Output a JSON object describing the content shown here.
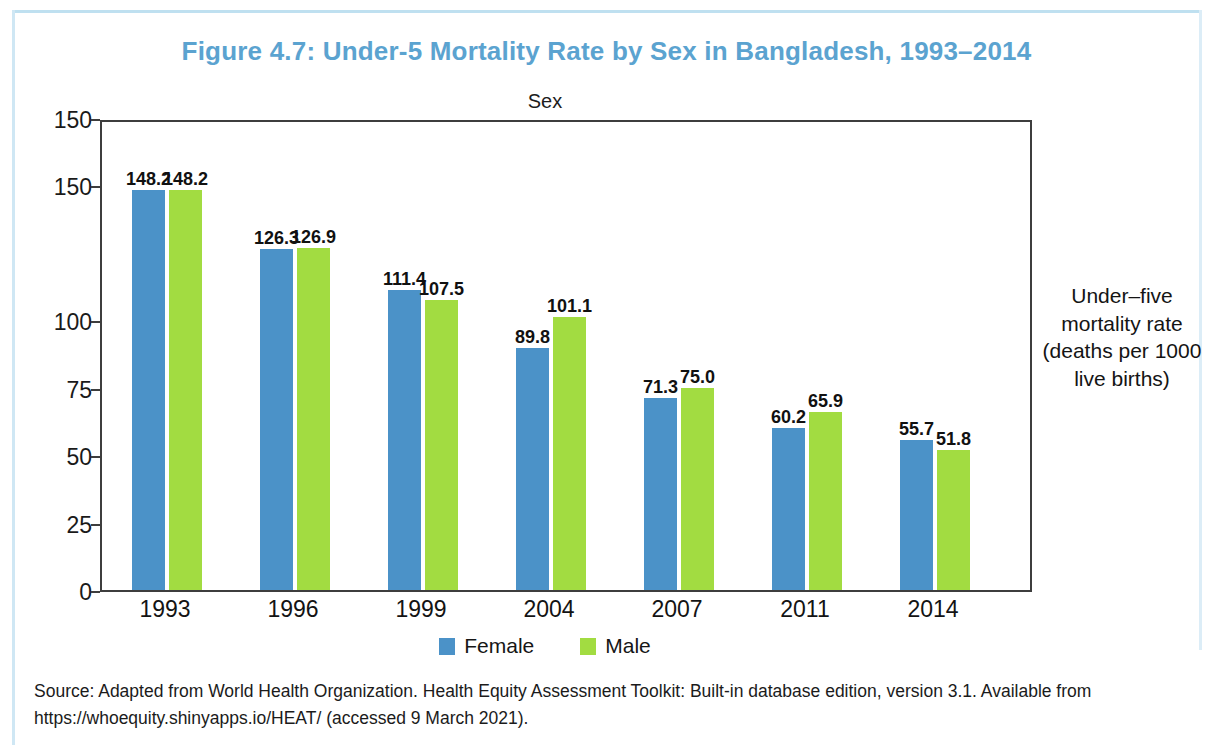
{
  "figure": {
    "title": "Figure 4.7: Under-5 Mortality Rate by Sex in Bangladesh, 1993–2014",
    "title_color": "#5ba3d0"
  },
  "source_note": "Source: Adapted from World Health Organization. Health Equity Assessment Toolkit: Built-in database edition, version 3.1. Available from https://whoequity.shinyapps.io/HEAT/ (accessed 9 March 2021).",
  "axis_caption": "Under–five mortality rate (deaths per 1000 live births)",
  "legend": {
    "title": "Sex",
    "items": [
      {
        "label": "Female",
        "color": "#4b92c8"
      },
      {
        "label": "Male",
        "color": "#a2dc41"
      }
    ]
  },
  "chart_data": {
    "type": "bar",
    "title": "Figure 4.7: Under-5 Mortality Rate by Sex in Bangladesh, 1993–2014",
    "xlabel": "",
    "ylabel": "Under-five mortality rate (deaths per 1000 live births)",
    "categories": [
      "1993",
      "1996",
      "1999",
      "2004",
      "2007",
      "2011",
      "2014"
    ],
    "series": [
      {
        "name": "Female",
        "color": "#4b92c8",
        "values": [
          148.2,
          126.3,
          111.4,
          89.8,
          71.3,
          60.2,
          55.7
        ]
      },
      {
        "name": "Male",
        "color": "#a2dc41",
        "values": [
          148.2,
          126.9,
          107.5,
          101.1,
          75.0,
          65.9,
          51.8
        ]
      }
    ],
    "ylim": [
      0,
      175
    ],
    "ytick_values": [
      175,
      150,
      100,
      75,
      50,
      25,
      0
    ],
    "ytick_labels": [
      "150",
      "150",
      "100",
      "75",
      "50",
      "25",
      "0"
    ],
    "grid": false,
    "legend_position": "bottom",
    "data_labels": true
  }
}
